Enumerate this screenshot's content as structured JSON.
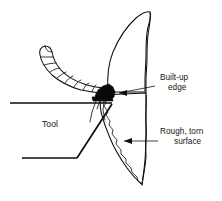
{
  "figure": {
    "background_color": "#ffffff",
    "line_color": "#101010",
    "fill_color": "#0a0a0a",
    "width": 222,
    "height": 201
  },
  "labels": {
    "built_up_edge": {
      "line1": "Built-up",
      "line2": "edge",
      "x": 160,
      "y": 80
    },
    "rough_torn_surface": {
      "line1": "Rough, torn",
      "line2": "surface",
      "x": 160,
      "y": 134
    },
    "tool": {
      "text": "Tool",
      "x": 42,
      "y": 127
    }
  },
  "annotations": [
    {
      "name": "built-up-edge-leader",
      "points": "Arrow from label at right pointing left to the black built-up edge wedge at the tool tip",
      "arrow_tip_x": 113,
      "arrow_tip_y": 94
    },
    {
      "name": "rough-torn-surface-leader",
      "points": "Arrow from label at right pointing left to the jagged machined surface",
      "arrow_tip_x": 122,
      "arrow_tip_y": 141
    }
  ],
  "parts": {
    "chip": "segmented curled chip rising up and to the left from the cutting edge",
    "chip_segments": 10,
    "workpiece": "leaf/horn shaped workpiece body to the right of the cutting edge",
    "built_up_edge": "solid black wedge of adhered work material at the tool cutting edge",
    "tool": "wedge-shaped cutting tool with horizontal rake face and angled flank face",
    "machined_surface": "rough torn surface shown as an irregular jagged line below the cutting edge"
  }
}
